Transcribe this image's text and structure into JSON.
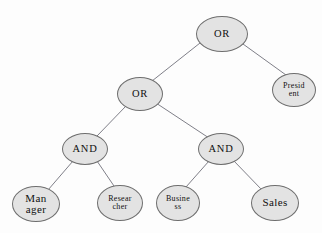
{
  "diagram": {
    "background_color": "#fdfdfd",
    "node_fill": "#e3e3e3",
    "node_stroke": "#6e6e6e",
    "edge_color": "#70707a",
    "nodes": [
      {
        "id": "or-root",
        "label": "OR",
        "type": "operator",
        "cx": 222,
        "cy": 34,
        "rx": 26,
        "ry": 18
      },
      {
        "id": "president",
        "label": "Presid\nent",
        "type": "leaf",
        "cx": 294,
        "cy": 90,
        "rx": 22,
        "ry": 17
      },
      {
        "id": "or-mid",
        "label": "OR",
        "type": "operator",
        "cx": 140,
        "cy": 94,
        "rx": 23,
        "ry": 17
      },
      {
        "id": "and-left",
        "label": "AND",
        "type": "operator",
        "cx": 85,
        "cy": 149,
        "rx": 23,
        "ry": 16
      },
      {
        "id": "and-right",
        "label": "AND",
        "type": "operator",
        "cx": 221,
        "cy": 149,
        "rx": 23,
        "ry": 16
      },
      {
        "id": "manager",
        "label": "Man\nager",
        "type": "leaf",
        "cx": 36,
        "cy": 204,
        "rx": 24,
        "ry": 18
      },
      {
        "id": "researcher",
        "label": "Resear\ncher",
        "type": "leaf",
        "cx": 120,
        "cy": 203,
        "rx": 23,
        "ry": 18
      },
      {
        "id": "business",
        "label": "Busine\nss",
        "type": "leaf",
        "cx": 178,
        "cy": 203,
        "rx": 22,
        "ry": 18
      },
      {
        "id": "sales",
        "label": "Sales",
        "type": "leaf",
        "cx": 275,
        "cy": 203,
        "rx": 24,
        "ry": 18
      }
    ],
    "edges": [
      {
        "id": "edge-or-root-or-mid",
        "from": "or-root",
        "to": "or-mid",
        "x1": 200,
        "y1": 43,
        "x2": 152,
        "y2": 81
      },
      {
        "id": "edge-or-root-president",
        "from": "or-root",
        "to": "president",
        "x1": 243,
        "y1": 44,
        "x2": 286,
        "y2": 75
      },
      {
        "id": "edge-or-mid-and-left",
        "from": "or-mid",
        "to": "and-left",
        "x1": 126,
        "y1": 106,
        "x2": 97,
        "y2": 136
      },
      {
        "id": "edge-or-mid-and-right",
        "from": "or-mid",
        "to": "and-right",
        "x1": 156,
        "y1": 103,
        "x2": 209,
        "y2": 138
      },
      {
        "id": "edge-and-left-manager",
        "from": "and-left",
        "to": "manager",
        "x1": 73,
        "y1": 161,
        "x2": 48,
        "y2": 190
      },
      {
        "id": "edge-and-left-researcher",
        "from": "and-left",
        "to": "researcher",
        "x1": 97,
        "y1": 161,
        "x2": 114,
        "y2": 186
      },
      {
        "id": "edge-and-right-business",
        "from": "and-right",
        "to": "business",
        "x1": 209,
        "y1": 161,
        "x2": 186,
        "y2": 187
      },
      {
        "id": "edge-and-right-sales",
        "from": "and-right",
        "to": "sales",
        "x1": 233,
        "y1": 160,
        "x2": 262,
        "y2": 190
      }
    ]
  }
}
